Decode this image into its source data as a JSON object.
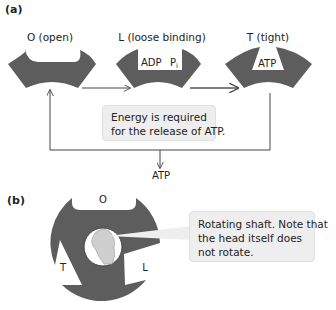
{
  "panel_a": {
    "label": "(a)",
    "states": [
      {
        "id": "open",
        "label": "O (open)"
      },
      {
        "id": "loose",
        "label": "L (loose binding)",
        "contents": [
          "ADP",
          "Pi"
        ]
      },
      {
        "id": "tight",
        "label": "T (tight)",
        "contents": [
          "ATP"
        ]
      }
    ],
    "pi_main": "P",
    "pi_sub": "i",
    "callout": {
      "line1": "Energy is required",
      "line2": "for the release of ATP."
    },
    "output_label": "ATP"
  },
  "panel_b": {
    "label": "(b)",
    "sites": {
      "top": "O",
      "left": "T",
      "right": "L"
    },
    "callout": {
      "line1": "Rotating shaft. Note that",
      "line2": "the head itself does",
      "line3": "not rotate."
    }
  },
  "colors": {
    "subunit": "#5d5d5d",
    "callout_bg": "#eeeeee",
    "shaft": "#cfcfcf",
    "line": "#444444"
  }
}
